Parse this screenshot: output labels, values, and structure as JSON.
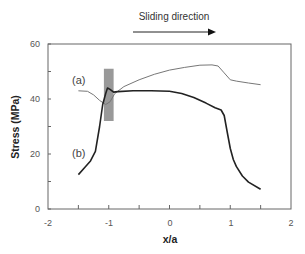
{
  "chart_data": {
    "type": "line",
    "title": "",
    "annotation": "Sliding direction",
    "xlabel": "x/a",
    "ylabel": "Stress (MPa)",
    "xlim": [
      -2,
      2
    ],
    "ylim": [
      0,
      60
    ],
    "x_ticks": [
      "-2",
      "-1",
      "0",
      "1",
      "2"
    ],
    "y_ticks": [
      "0",
      "20",
      "40",
      "60"
    ],
    "x_minor_ticks": [
      -1.5,
      -1,
      -0.5,
      0,
      0.5,
      1,
      1.5
    ],
    "y_minor_ticks": [
      10,
      30,
      50
    ],
    "grid": false,
    "legend": "inline labels",
    "highlight_region": {
      "x": [
        -1.08,
        -0.92
      ],
      "y": [
        32,
        51
      ],
      "color": "#999999"
    },
    "series": [
      {
        "name": "(a)",
        "color": "#777777",
        "line_width": 1,
        "x": [
          -1.5,
          -1.35,
          -1.25,
          -1.15,
          -1.05,
          -0.98,
          -0.9,
          -0.75,
          -0.5,
          -0.25,
          0,
          0.25,
          0.5,
          0.7,
          0.8,
          0.9,
          1.0,
          1.1,
          1.3,
          1.5
        ],
        "y": [
          43,
          42.8,
          41.5,
          39.5,
          38,
          39,
          42,
          44.5,
          47,
          49,
          50.5,
          51.5,
          52.3,
          52.4,
          52,
          49.5,
          47,
          46.5,
          45.8,
          45.2
        ]
      },
      {
        "name": "(b)",
        "color": "#222222",
        "line_width": 1.6,
        "x": [
          -1.5,
          -1.4,
          -1.3,
          -1.22,
          -1.15,
          -1.1,
          -1.05,
          -1.02,
          -0.98,
          -0.92,
          -0.85,
          -0.6,
          -0.3,
          0,
          0.2,
          0.4,
          0.6,
          0.75,
          0.85,
          0.9,
          0.95,
          1.0,
          1.05,
          1.1,
          1.2,
          1.3,
          1.5
        ],
        "y": [
          12.5,
          15,
          17.5,
          21,
          30,
          38,
          42,
          44,
          43.5,
          42.5,
          42.7,
          43,
          43,
          42.8,
          42,
          40.5,
          38.5,
          36.8,
          36,
          34,
          28,
          22,
          18,
          15.5,
          12,
          9.8,
          7.2
        ]
      }
    ]
  },
  "labels": {
    "annotation": "Sliding direction",
    "xlabel": "x/a",
    "ylabel": "Stress (MPa)",
    "series_a": "(a)",
    "series_b": "(b)",
    "x_ticks": [
      "-2",
      "-1",
      "0",
      "1",
      "2"
    ],
    "y_ticks": [
      "0",
      "20",
      "40",
      "60"
    ]
  }
}
